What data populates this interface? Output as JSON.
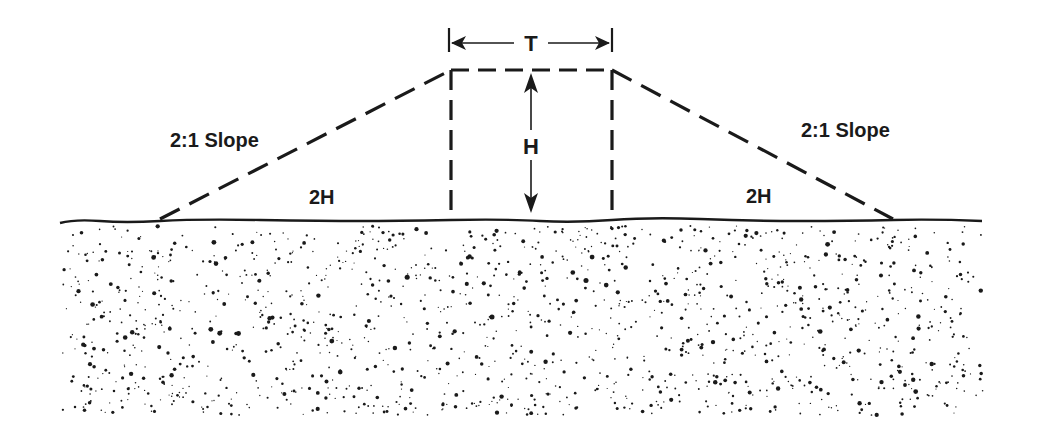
{
  "diagram": {
    "colors": {
      "ink": "#1a1a1a",
      "background": "#ffffff"
    },
    "labels": {
      "top_width": "T",
      "height": "H",
      "left_slope": "2:1 Slope",
      "right_slope": "2:1 Slope",
      "left_run": "2H",
      "right_run": "2H"
    },
    "geometry": {
      "ground_y": 221,
      "crest_y": 70,
      "left_toe_x": 160,
      "left_crest_x": 451,
      "right_crest_x": 612,
      "right_toe_x": 893,
      "ground_start_x": 60,
      "ground_end_x": 982
    },
    "soil": {
      "dot_count": 1500,
      "area": {
        "x0": 60,
        "y0": 226,
        "x1": 985,
        "y1": 415
      }
    }
  }
}
